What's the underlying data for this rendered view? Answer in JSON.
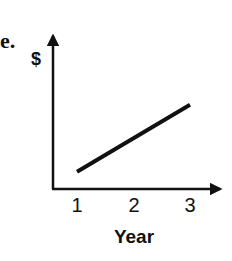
{
  "panel_label": "e.",
  "chart_data": {
    "type": "line",
    "title": "",
    "xlabel": "Year",
    "ylabel": "$",
    "x": [
      1,
      2,
      3
    ],
    "x_tick_labels": [
      "1",
      "2",
      "3"
    ],
    "series": [
      {
        "name": "$",
        "x": [
          1,
          3
        ],
        "values": [
          0.11,
          0.54
        ]
      }
    ],
    "ylim": [
      0,
      1
    ],
    "y_ticks": [],
    "grid": false,
    "legend": null
  },
  "colors": {
    "line": "#111111",
    "axis": "#111111"
  }
}
